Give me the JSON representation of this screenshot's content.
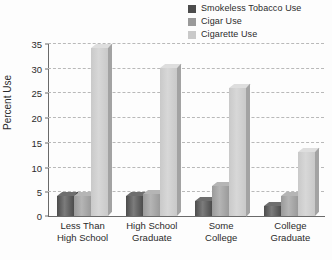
{
  "chart_data": {
    "type": "bar",
    "title": "",
    "xlabel": "",
    "ylabel": "Percent Use",
    "ylim": [
      0,
      35
    ],
    "ytick_values": [
      0,
      5,
      10,
      15,
      20,
      25,
      30,
      35
    ],
    "ytick_labels": [
      "0",
      "5",
      "10",
      "15",
      "20",
      "25",
      "30",
      "35"
    ],
    "grid": true,
    "legend_position": "top-right",
    "categories": [
      "Less Than High School",
      "High School Graduate",
      "Some College",
      "College Graduate"
    ],
    "category_lines": [
      [
        "Less Than",
        "High School"
      ],
      [
        "High School",
        "Graduate"
      ],
      [
        "Some",
        "College"
      ],
      [
        "College",
        "Graduate"
      ]
    ],
    "series": [
      {
        "name": "Smokeless Tobacco Use",
        "color": "#4c4c4c",
        "top_color": "#6e6e6e",
        "side_color": "#333333",
        "values": [
          4,
          4,
          3,
          2
        ]
      },
      {
        "name": "Cigar Use",
        "color": "#9a9a9a",
        "top_color": "#b5b5b5",
        "side_color": "#7b7b7b",
        "values": [
          4,
          4.5,
          6,
          4
        ]
      },
      {
        "name": "Cigarette Use",
        "color": "#c9c9c9",
        "top_color": "#dedede",
        "side_color": "#a3a3a3",
        "values": [
          34,
          30,
          26,
          13
        ]
      }
    ]
  },
  "legend": {
    "items": [
      {
        "label": "Smokeless Tobacco Use",
        "color": "#4c4c4c"
      },
      {
        "label": "Cigar Use",
        "color": "#9a9a9a"
      },
      {
        "label": "Cigarette Use",
        "color": "#c9c9c9"
      }
    ]
  },
  "axis": {
    "y_title": "Percent Use"
  }
}
